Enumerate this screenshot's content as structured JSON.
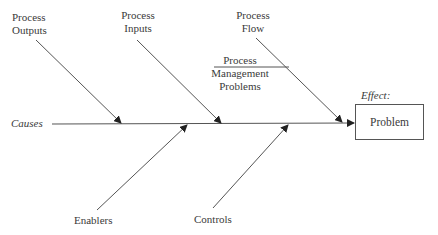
{
  "diagram": {
    "type": "fishbone",
    "spine_label": "Causes",
    "effect_label": "Effect:",
    "effect": "Problem",
    "branches": {
      "process_outputs": {
        "line1": "Process",
        "line2": "Outputs"
      },
      "process_inputs": {
        "line1": "Process",
        "line2": "Inputs"
      },
      "process_flow": {
        "line1": "Process",
        "line2": "Flow"
      },
      "process_management": {
        "line1": "Process",
        "line2": "Management",
        "line3": "Problems"
      },
      "enablers": {
        "line1": "Enablers"
      },
      "controls": {
        "line1": "Controls"
      }
    },
    "line_color": "#444444"
  }
}
